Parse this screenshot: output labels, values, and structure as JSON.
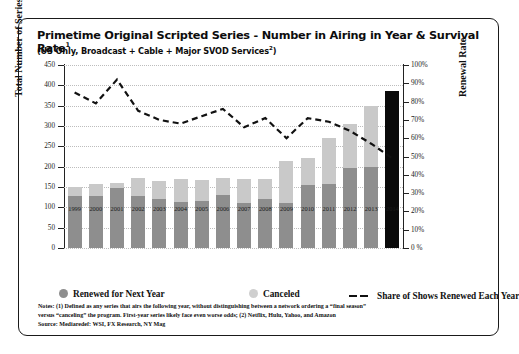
{
  "header": {
    "title": "Primetime Original Scripted Series - Number in Airing in Year & Survival Rate",
    "title_sup": "1",
    "subtitle": "(US Only, Broadcast + Cable + Major SVOD Services",
    "subtitle_sup": "2",
    "subtitle_tail": ")"
  },
  "legend": {
    "items": [
      {
        "label": "Renewed for Next Year",
        "marker": "circle",
        "color": "#8e8e8e"
      },
      {
        "label": "Canceled",
        "marker": "circle",
        "color": "#cfcfcf"
      },
      {
        "label": "Share of Shows Renewed Each Year",
        "marker": "dashed-line",
        "color": "#111111"
      }
    ]
  },
  "notes": {
    "line1": "Notes: (1) Defined as any series that airs the following year, without distinguishing between a network ordering a “final season”",
    "line2": "versus “canceling” the program. First-year series likely face even worse odds; (2) Netflix, Hulu, Yahoo, and Amazon",
    "line3": "Source: Mediaredef: WSI, FX Research, NY Mag"
  },
  "chart_data": {
    "type": "bar",
    "title": "Primetime Original Scripted Series - Number in Airing in Year & Survival Rate",
    "xlabel": "",
    "ylabel": "Total Number of Series",
    "y2label": "Renewal Rate",
    "ylim": [
      0,
      450
    ],
    "y2lim": [
      0,
      100
    ],
    "yticks": [
      0,
      50,
      100,
      150,
      200,
      250,
      300,
      350,
      400,
      450
    ],
    "ytick_labels": [
      "0",
      "50",
      "100",
      "150",
      "200",
      "250",
      "300",
      "350",
      "400",
      "450"
    ],
    "y2ticks": [
      0,
      10,
      20,
      30,
      40,
      50,
      60,
      70,
      80,
      90,
      100
    ],
    "y2tick_labels": [
      "0 %",
      "10%",
      "20%",
      "30%",
      "40%",
      "50%",
      "60%",
      "70%",
      "80%",
      "90%",
      "100%"
    ],
    "grid": true,
    "legend_position": "below",
    "stacked": true,
    "categories": [
      "1999",
      "2000",
      "2001",
      "2002",
      "2003",
      "2004",
      "2005",
      "2006",
      "2007",
      "2008",
      "2009",
      "2010",
      "2011",
      "2012",
      "2013",
      "2014"
    ],
    "series": [
      {
        "name": "Renewed for Next Year",
        "color": "#8e8e8e",
        "values": [
          128,
          128,
          147,
          128,
          120,
          112,
          116,
          130,
          110,
          120,
          110,
          155,
          158,
          196,
          198,
          190
        ]
      },
      {
        "name": "Canceled",
        "color": "#cfcfcf",
        "values": [
          23,
          29,
          13,
          43,
          46,
          58,
          51,
          42,
          60,
          50,
          105,
          67,
          112,
          110,
          151,
          195
        ]
      }
    ],
    "totals": [
      151,
      157,
      160,
      171,
      166,
      170,
      167,
      172,
      170,
      170,
      215,
      222,
      270,
      306,
      349,
      385
    ],
    "line_series": {
      "name": "Share of Shows Renewed Each Year",
      "color": "#111111",
      "style": "dashed",
      "axis": "right",
      "values": [
        85,
        79,
        92,
        75,
        70,
        68,
        72,
        76,
        66,
        71,
        60,
        71,
        69,
        64,
        57,
        49
      ]
    },
    "highlight_bar": {
      "category": "2014",
      "color": "#0a0a0a"
    }
  }
}
